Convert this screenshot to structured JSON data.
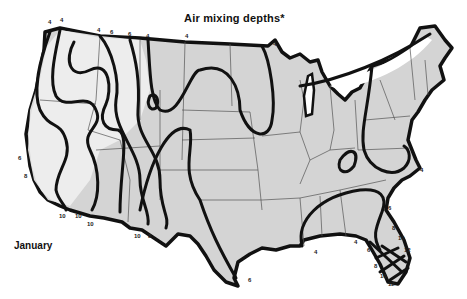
{
  "map": {
    "title": "Air mixing depths*",
    "caption": "January",
    "region": "Contiguous United States",
    "legend_note": "Isopleths of mixing depth (thousands of feet)",
    "colors": {
      "land": "#d4d4d4",
      "low_area": "#f2f2f2",
      "isopleth": "#111111",
      "state_border": "#555555"
    },
    "contour_labels": {
      "north_border": [
        "4",
        "4",
        "4",
        "6",
        "6",
        "4",
        "4",
        "4"
      ],
      "west_coast": [
        "6",
        "8"
      ],
      "southwest_border": [
        "10",
        "10",
        "10",
        "10",
        "8"
      ],
      "texas_coast": [
        "6"
      ],
      "gulf_coast": [
        "4",
        "4"
      ],
      "east_coast": [
        "4",
        "6"
      ],
      "florida_east": [
        "8",
        "10",
        "12"
      ],
      "florida_west": [
        "6",
        "8",
        "10",
        "12"
      ]
    }
  }
}
